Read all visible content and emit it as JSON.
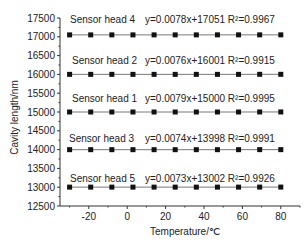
{
  "chart_data": {
    "type": "scatter",
    "title": "",
    "xlabel": "Temperature/℃",
    "ylabel": "Cavity length/nm",
    "xlim": [
      -35,
      90
    ],
    "ylim": [
      12500,
      17500
    ],
    "xticks": [
      -20,
      0,
      20,
      40,
      60,
      80
    ],
    "yticks": [
      12500,
      13000,
      13500,
      14000,
      14500,
      15000,
      15500,
      16000,
      16500,
      17000,
      17500
    ],
    "grid": false,
    "x": [
      -30,
      -19,
      -8,
      3,
      14,
      25,
      36,
      47,
      58,
      69,
      80
    ],
    "series": [
      {
        "name": "Sensor head 4",
        "equation": "y=0.0078x+17051",
        "r2": "R²=0.9967",
        "slope": 0.0078,
        "intercept": 17051,
        "values": [
          17051,
          17051,
          17051,
          17051,
          17051,
          17051,
          17051,
          17052,
          17052,
          17052,
          17052
        ]
      },
      {
        "name": "Sensor head 2",
        "equation": "y=0.0076x+16001",
        "r2": "R²=0.9915",
        "slope": 0.0076,
        "intercept": 16001,
        "values": [
          16001,
          16001,
          16001,
          16001,
          16001,
          16001,
          16001,
          16001,
          16001,
          16002,
          16002
        ]
      },
      {
        "name": "Sensor head 1",
        "equation": "y=0.0079x+15000",
        "r2": "R²=0.9995",
        "slope": 0.0079,
        "intercept": 15000,
        "values": [
          15000,
          15000,
          15000,
          15000,
          15000,
          15000,
          15000,
          15000,
          15000,
          15001,
          15001
        ]
      },
      {
        "name": "Sensor head 3",
        "equation": "y=0.0074x+13998",
        "r2": "R²=0.9991",
        "slope": 0.0074,
        "intercept": 13998,
        "values": [
          13998,
          13998,
          13998,
          13998,
          13998,
          13998,
          13998,
          13998,
          13998,
          13999,
          13999
        ]
      },
      {
        "name": "Sensor head 5",
        "equation": "y=0.0073x+13002",
        "r2": "R²=0.9926",
        "slope": 0.0073,
        "intercept": 13002,
        "values": [
          13002,
          13002,
          13002,
          13002,
          13002,
          13002,
          13002,
          13002,
          13002,
          13003,
          13003
        ]
      }
    ]
  },
  "labels": {
    "s4": "Sensor head 4",
    "e4": "y=0.0078x+17051 R²=0.9967",
    "s2": "Sensor head 2",
    "e2": "y=0.0076x+16001 R²=0.9915",
    "s1": "Sensor head 1",
    "e1": "y=0.0079x+15000 R²=0.9995",
    "s3": "Sensor head 3",
    "e3": "y=0.0074x+13998 R²=0.9991",
    "s5": "Sensor head 5",
    "e5": "y=0.0073x+13002 R²=0.9926"
  }
}
